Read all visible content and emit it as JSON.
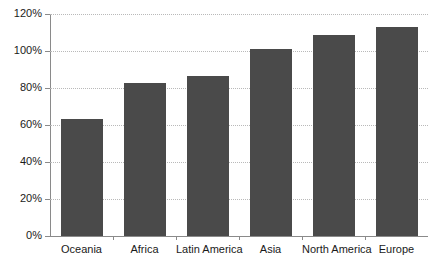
{
  "chart_data": {
    "type": "bar",
    "title": "",
    "subtitle": "",
    "xlabel": "",
    "ylabel": "",
    "categories": [
      "Oceania",
      "Africa",
      "Latin America",
      "Asia",
      "North America",
      "Europe"
    ],
    "values": [
      63,
      82.5,
      86.5,
      101,
      108.5,
      113
    ],
    "ylim": [
      0,
      120
    ],
    "ytick_values": [
      0,
      20,
      40,
      60,
      80,
      100,
      120
    ],
    "ytick_labels": [
      "0%",
      "20%",
      "40%",
      "60%",
      "80%",
      "100%",
      "120%"
    ],
    "grid": true,
    "grid_axis": "y",
    "grid_style": "dotted",
    "legend": false,
    "legend_position": "none",
    "bar_color": "#4a4a4a",
    "grid_color": "#b9b9b9",
    "axis_color": "#8a8a8a",
    "text_color": "#1a1a1a",
    "background": "#ffffff",
    "value_format": "percent",
    "annotations": []
  }
}
